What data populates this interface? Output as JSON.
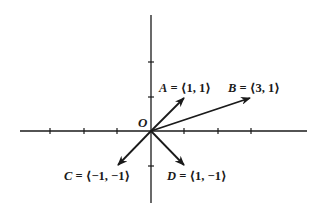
{
  "diagram": {
    "type": "vector-plot",
    "origin_label": "O",
    "colors": {
      "ink": "#1a1a1a",
      "background": "#ffffff"
    },
    "axes": {
      "x_ticks": [
        -3,
        -2,
        -1,
        1,
        2,
        3
      ],
      "y_ticks": [
        -1,
        1,
        2
      ]
    },
    "vectors": [
      {
        "name": "A",
        "components": [
          1,
          1
        ],
        "label_name": "A",
        "label_eq": " = ",
        "label_vec": "⟨1, 1⟩"
      },
      {
        "name": "B",
        "components": [
          3,
          1
        ],
        "label_name": "B",
        "label_eq": " = ",
        "label_vec": "⟨3, 1⟩"
      },
      {
        "name": "C",
        "components": [
          -1,
          -1
        ],
        "label_name": "C",
        "label_eq": " = ",
        "label_vec": "⟨−1, −1⟩"
      },
      {
        "name": "D",
        "components": [
          1,
          -1
        ],
        "label_name": "D",
        "label_eq": " = ",
        "label_vec": "⟨1, −1⟩"
      }
    ]
  }
}
